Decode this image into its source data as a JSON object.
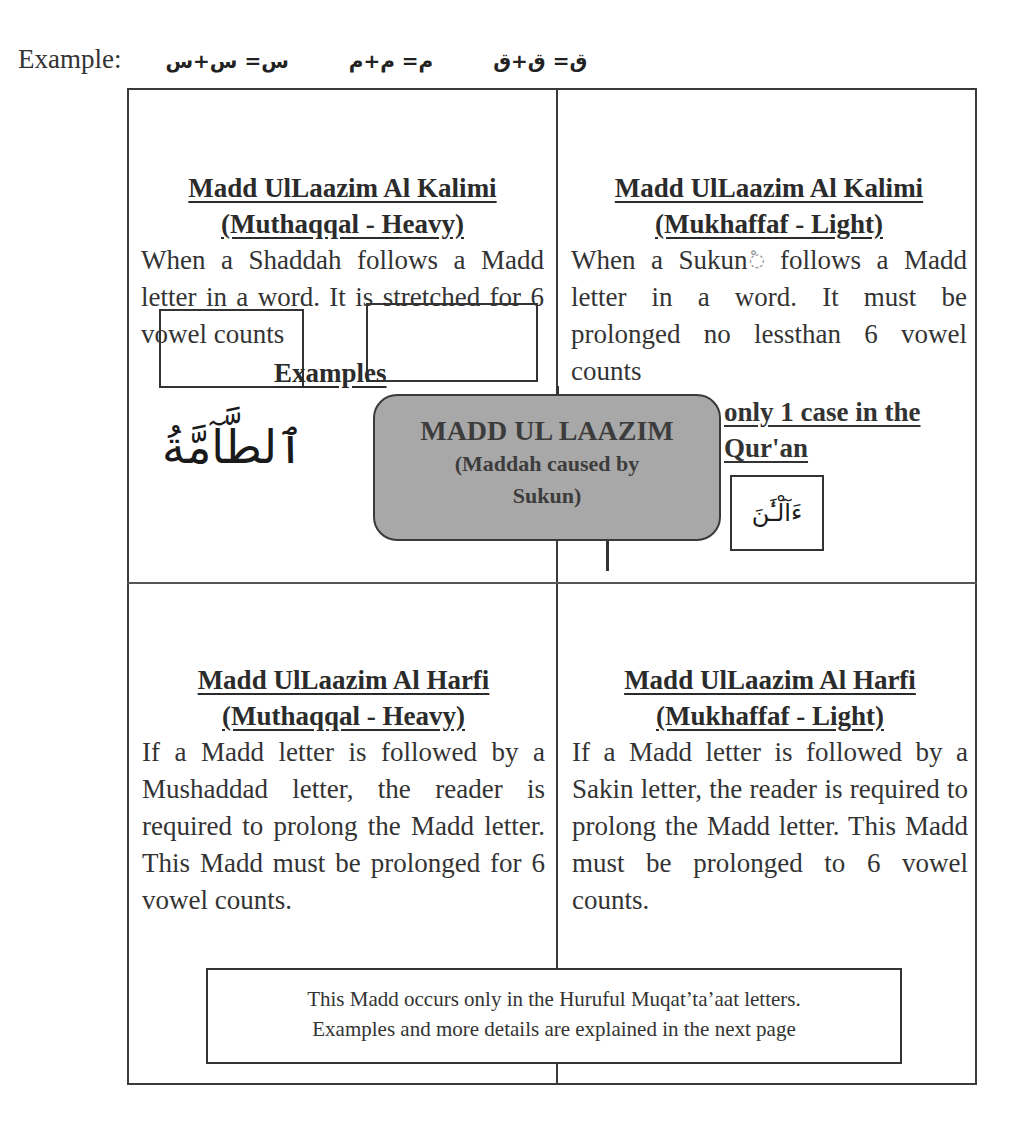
{
  "example_line": {
    "label": "Example:",
    "equations": [
      "ق= ق+ق",
      "م= م+م",
      "س= س+س"
    ]
  },
  "cells": {
    "top_left": {
      "title_line1": "Madd UlLaazim Al Kalimi",
      "title_line2": "(Muthaqqal - Heavy)",
      "body": "When a Shaddah follows a Madd letter in a word. It is stretched for 6 vowel counts",
      "examples_heading": "Examples",
      "arabic_example": "ٱلطَّآمَّةُ"
    },
    "top_right": {
      "title_line1": "Madd UlLaazim Al Kalimi",
      "title_line2": "(Mukhaffaf - Light)",
      "body_part1": "When a Sukun",
      "sukun_symbol": "◌ْ",
      "body_part2": " follows a Madd letter in a word. It must be prolonged no lessthan 6 vowel counts",
      "only_case": "only 1 case in the Qur'an",
      "arabic_example": "ءَآلْـَٰٔنَ"
    },
    "bottom_left": {
      "title_line1": "Madd UlLaazim Al Harfi",
      "title_line2": "(Muthaqqal - Heavy)",
      "body": "If a Madd letter is followed by a Mushaddad letter, the reader is required to prolong the Madd letter. This Madd must be prolonged for 6 vowel counts."
    },
    "bottom_right": {
      "title_line1": "Madd UlLaazim Al Harfi",
      "title_line2": "(Mukhaffaf - Light)",
      "body": "If a Madd letter is followed by a Sakin letter, the reader is required to prolong the Madd letter. This Madd must be prolonged to 6 vowel counts."
    }
  },
  "center": {
    "title": "MADD UL LAAZIM",
    "subtitle_line1": "(Maddah caused by",
    "subtitle_line2": "Sukun)",
    "fill_color": "#a8a8a8"
  },
  "footer": {
    "line1": "This Madd occurs only in the Huruful Muqat’ta’aat letters.",
    "line2": "Examples and more details are explained in the next page"
  }
}
